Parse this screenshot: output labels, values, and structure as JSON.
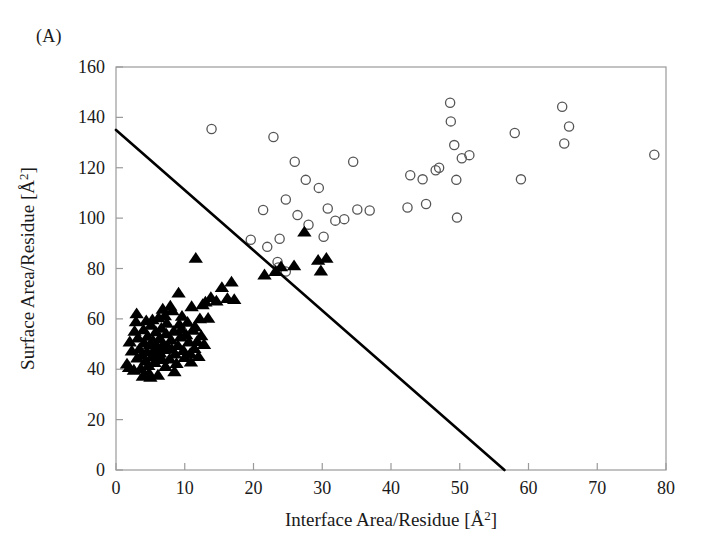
{
  "panel": {
    "label": "(A)"
  },
  "chart_data": {
    "type": "scatter",
    "title": "",
    "xlabel": "Interface Area/Residue [Å²]",
    "ylabel": "Surface Area/Residue [Å²]",
    "xlim": [
      0,
      80
    ],
    "ylim": [
      0,
      160
    ],
    "xticks": [
      0,
      10,
      20,
      30,
      40,
      50,
      60,
      70,
      80
    ],
    "yticks": [
      0,
      20,
      40,
      60,
      80,
      100,
      120,
      140,
      160
    ],
    "xtick_labels": [
      "0",
      "10",
      "20",
      "30",
      "40",
      "50",
      "60",
      "70",
      "80"
    ],
    "ytick_labels": [
      "0",
      "20",
      "40",
      "60",
      "80",
      "100",
      "120",
      "140",
      "160"
    ],
    "grid": false,
    "legend": "none",
    "series": [
      {
        "name": "open-circles",
        "marker": "open-circle",
        "color": "#555555",
        "points": [
          [
            13.9,
            135.4
          ],
          [
            22.9,
            132.2
          ],
          [
            26.0,
            122.4
          ],
          [
            27.6,
            115.2
          ],
          [
            29.5,
            112.0
          ],
          [
            24.7,
            107.4
          ],
          [
            26.4,
            101.2
          ],
          [
            28.0,
            97.4
          ],
          [
            23.8,
            91.8
          ],
          [
            19.6,
            91.4
          ],
          [
            22.0,
            88.6
          ],
          [
            21.4,
            103.2
          ],
          [
            23.5,
            82.6
          ],
          [
            23.6,
            80.4
          ],
          [
            24.7,
            78.8
          ],
          [
            30.2,
            92.6
          ],
          [
            31.9,
            99.0
          ],
          [
            34.5,
            122.4
          ],
          [
            35.1,
            103.4
          ],
          [
            33.2,
            99.6
          ],
          [
            30.8,
            103.8
          ],
          [
            36.9,
            103.0
          ],
          [
            42.4,
            104.2
          ],
          [
            42.8,
            117.0
          ],
          [
            45.1,
            105.6
          ],
          [
            44.6,
            115.4
          ],
          [
            46.5,
            119.0
          ],
          [
            47.0,
            120.0
          ],
          [
            48.6,
            145.8
          ],
          [
            48.7,
            138.4
          ],
          [
            49.2,
            129.0
          ],
          [
            49.5,
            115.2
          ],
          [
            50.3,
            123.8
          ],
          [
            51.4,
            125.0
          ],
          [
            49.6,
            100.2
          ],
          [
            58.0,
            133.8
          ],
          [
            58.9,
            115.4
          ],
          [
            64.9,
            144.2
          ],
          [
            65.9,
            136.4
          ],
          [
            65.2,
            129.6
          ],
          [
            78.3,
            125.2
          ]
        ]
      },
      {
        "name": "filled-triangles",
        "marker": "filled-triangle",
        "color": "#000000",
        "points": [
          [
            1.6,
            42.0
          ],
          [
            1.9,
            40.6
          ],
          [
            2.3,
            47.2
          ],
          [
            2.6,
            39.6
          ],
          [
            2.9,
            58.8
          ],
          [
            3.1,
            44.4
          ],
          [
            3.2,
            52.4
          ],
          [
            3.4,
            48.0
          ],
          [
            3.6,
            40.2
          ],
          [
            3.8,
            45.6
          ],
          [
            4.0,
            55.6
          ],
          [
            4.1,
            50.4
          ],
          [
            4.3,
            43.2
          ],
          [
            4.5,
            46.8
          ],
          [
            4.6,
            53.0
          ],
          [
            4.8,
            38.4
          ],
          [
            4.9,
            49.6
          ],
          [
            5.1,
            57.4
          ],
          [
            5.2,
            44.8
          ],
          [
            5.4,
            51.2
          ],
          [
            5.5,
            47.0
          ],
          [
            5.6,
            42.6
          ],
          [
            5.8,
            54.8
          ],
          [
            5.9,
            49.0
          ],
          [
            6.0,
            45.2
          ],
          [
            6.2,
            60.4
          ],
          [
            6.3,
            52.0
          ],
          [
            6.4,
            46.4
          ],
          [
            6.6,
            56.2
          ],
          [
            6.7,
            43.8
          ],
          [
            6.9,
            50.0
          ],
          [
            7.0,
            47.8
          ],
          [
            7.2,
            41.0
          ],
          [
            7.3,
            54.0
          ],
          [
            7.4,
            58.2
          ],
          [
            7.6,
            48.6
          ],
          [
            7.8,
            44.0
          ],
          [
            8.0,
            51.6
          ],
          [
            8.2,
            63.2
          ],
          [
            8.4,
            55.0
          ],
          [
            8.6,
            46.0
          ],
          [
            8.8,
            42.2
          ],
          [
            9.0,
            49.4
          ],
          [
            9.2,
            57.8
          ],
          [
            9.4,
            52.8
          ],
          [
            9.6,
            61.0
          ],
          [
            9.8,
            47.4
          ],
          [
            10.0,
            44.6
          ],
          [
            10.2,
            53.6
          ],
          [
            10.4,
            58.6
          ],
          [
            10.6,
            50.8
          ],
          [
            10.8,
            46.2
          ],
          [
            11.0,
            64.8
          ],
          [
            11.2,
            55.4
          ],
          [
            11.4,
            48.2
          ],
          [
            11.6,
            84.0
          ],
          [
            11.8,
            51.0
          ],
          [
            12.0,
            45.0
          ],
          [
            12.2,
            60.0
          ],
          [
            12.4,
            53.2
          ],
          [
            12.6,
            65.6
          ],
          [
            13.0,
            66.6
          ],
          [
            13.4,
            60.2
          ],
          [
            13.8,
            68.4
          ],
          [
            14.6,
            67.0
          ],
          [
            15.4,
            72.4
          ],
          [
            16.2,
            68.0
          ],
          [
            16.8,
            74.6
          ],
          [
            17.2,
            67.6
          ],
          [
            5.0,
            36.8
          ],
          [
            6.1,
            37.6
          ],
          [
            8.5,
            39.0
          ],
          [
            3.0,
            62.0
          ],
          [
            4.4,
            59.2
          ],
          [
            7.9,
            65.0
          ],
          [
            9.1,
            70.2
          ],
          [
            21.6,
            77.4
          ],
          [
            23.2,
            78.8
          ],
          [
            24.0,
            80.6
          ],
          [
            27.4,
            94.4
          ],
          [
            29.4,
            83.2
          ],
          [
            30.6,
            84.0
          ],
          [
            29.8,
            79.0
          ],
          [
            25.9,
            81.0
          ],
          [
            10.9,
            42.8
          ],
          [
            11.5,
            56.8
          ],
          [
            12.8,
            49.8
          ],
          [
            6.8,
            63.8
          ],
          [
            2.0,
            50.8
          ],
          [
            2.7,
            55.0
          ],
          [
            8.1,
            48.0
          ],
          [
            9.5,
            55.8
          ],
          [
            5.3,
            59.6
          ],
          [
            7.1,
            61.2
          ],
          [
            4.7,
            41.4
          ],
          [
            3.9,
            37.2
          ]
        ]
      }
    ],
    "annotations": [
      {
        "type": "line",
        "name": "separating-line",
        "x": [
          0,
          56.5
        ],
        "y": [
          135,
          0
        ],
        "color": "#000000",
        "width": 2.6
      }
    ]
  }
}
